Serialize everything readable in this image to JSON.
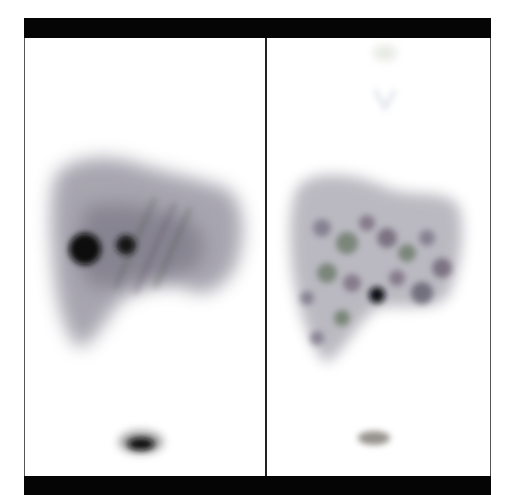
{
  "figure": {
    "panels": [
      {
        "id": "left",
        "description": "planar scintigraphy, anterior liver view with two focal hot spots and spleen tip below",
        "features": [
          "liver-silhouette",
          "hot-spot-large",
          "hot-spot-small",
          "spleen-spot"
        ]
      },
      {
        "id": "right",
        "description": "mottled heterogeneous liver uptake with a central focal hot spot and spleen tip below",
        "features": [
          "liver-silhouette-mottled",
          "hot-spot-central",
          "spleen-spot",
          "faint-uptake-top"
        ]
      }
    ],
    "colors": {
      "bars": "#050505",
      "background": "#ffffff",
      "uptake": "#6e6a7a",
      "hot": "#0a0a0a"
    }
  }
}
